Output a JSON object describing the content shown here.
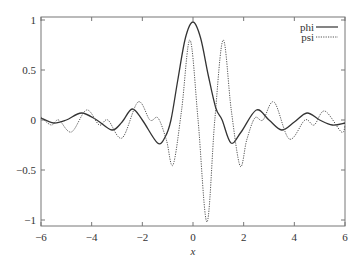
{
  "chart_data": {
    "type": "line",
    "title": "",
    "xlabel": "x",
    "ylabel": "",
    "xlim": [
      -6,
      6
    ],
    "ylim": [
      -1.05,
      1.03
    ],
    "grid": false,
    "legend_position": "top-right",
    "x_ticks": [
      -6,
      -4,
      -2,
      0,
      2,
      4,
      6
    ],
    "x_tick_labels": [
      "−6",
      "−4",
      "−2",
      "0",
      "2",
      "4",
      "6"
    ],
    "y_ticks": [
      1,
      0.5,
      0,
      -0.5,
      -1
    ],
    "y_tick_labels": [
      "1",
      "0.5",
      "0",
      "−0.5",
      "−1"
    ],
    "series": [
      {
        "name": "phi",
        "style": "solid",
        "color": "#333333",
        "x": [
          -6,
          -5.5,
          -5,
          -4.4,
          -3.8,
          -3.2,
          -2.8,
          -2.4,
          -2.0,
          -1.4,
          -1.1,
          -0.87,
          -0.6,
          -0.3,
          0,
          0.3,
          0.6,
          0.9,
          1.15,
          1.5,
          1.9,
          2.5,
          3.0,
          3.5,
          4.0,
          4.5,
          5.0,
          5.5,
          6
        ],
        "values": [
          0.02,
          -0.03,
          0.0,
          0.07,
          0.0,
          -0.1,
          -0.02,
          0.11,
          0.0,
          -0.23,
          -0.17,
          0.0,
          0.4,
          0.82,
          0.98,
          0.82,
          0.45,
          0.12,
          0.0,
          -0.23,
          -0.12,
          0.1,
          0.0,
          -0.1,
          -0.02,
          0.07,
          0.0,
          -0.05,
          -0.03
        ]
      },
      {
        "name": "psi",
        "style": "dotted",
        "color": "#555555",
        "x": [
          -6,
          -5.6,
          -5.3,
          -4.8,
          -4.2,
          -3.7,
          -3.36,
          -2.8,
          -2.17,
          -1.7,
          -1.38,
          -1.05,
          -0.79,
          -0.45,
          -0.12,
          0.2,
          0.55,
          0.86,
          1.19,
          1.51,
          1.86,
          2.12,
          2.44,
          2.76,
          3.2,
          3.8,
          4.42,
          4.78,
          5.2,
          5.86,
          6
        ],
        "values": [
          0.03,
          -0.05,
          0.0,
          -0.12,
          0.1,
          -0.05,
          0.0,
          -0.18,
          0.18,
          0.0,
          0.02,
          -0.2,
          -0.45,
          0.1,
          0.8,
          0.0,
          -1.02,
          0.0,
          0.8,
          0.1,
          -0.46,
          -0.2,
          0.02,
          0.0,
          0.18,
          -0.19,
          0.0,
          -0.05,
          0.09,
          -0.12,
          -0.05
        ]
      }
    ]
  }
}
